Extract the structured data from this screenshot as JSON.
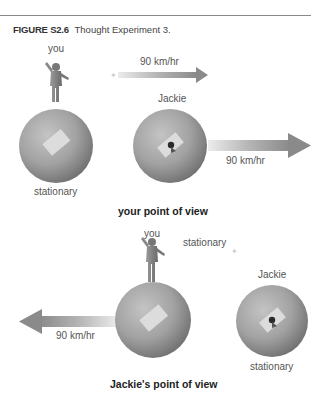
{
  "figure": {
    "number": "FIGURE S2.6",
    "title": "Thought Experiment 3."
  },
  "panel_top": {
    "title": "your point of view",
    "you_label": "you",
    "you_state": "stationary",
    "jackie_label": "Jackie",
    "small_arrow_label": "90 km/hr",
    "big_arrow_label": "90 km/hr",
    "arrow_direction": "right"
  },
  "panel_bottom": {
    "title": "Jackie's point of view",
    "you_label": "you",
    "star_label": "stationary",
    "jackie_label": "Jackie",
    "jackie_state": "stationary",
    "big_arrow_label": "90 km/hr",
    "arrow_direction": "left"
  },
  "colors": {
    "sphere_light": "#c8c8c8",
    "sphere_dark": "#6e6e6e",
    "arrow": "#8c8c8c",
    "panel": "#e6e6e6"
  }
}
